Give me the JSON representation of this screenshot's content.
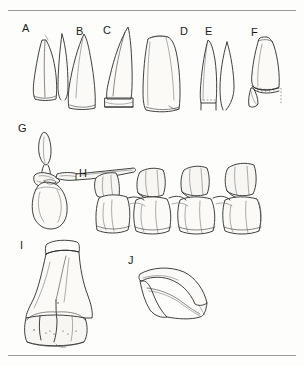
{
  "plate": {
    "title": "Fossil element plate",
    "background_color": "#fdfdfb",
    "ink_color": "#2b2b2b",
    "width": 304,
    "height": 366,
    "style": "stippled pen-and-ink scientific illustration",
    "rules": [
      {
        "name": "top-rule",
        "y": 10
      },
      {
        "name": "bottom-rule",
        "y": 355
      }
    ]
  },
  "figures": [
    {
      "letter": "A",
      "label_x": 22,
      "label_y": 28,
      "subject": "tooth crown, recurved, stippled, with adjacent partial outline",
      "group": "teeth"
    },
    {
      "letter": "B",
      "label_x": 76,
      "label_y": 31,
      "subject": "tooth crown, strongly recurved, densely stippled",
      "group": "teeth"
    },
    {
      "letter": "C",
      "label_x": 103,
      "label_y": 30,
      "subject": "tooth crown with hatched serrated basal band",
      "group": "teeth"
    },
    {
      "letter": "D",
      "label_x": 180,
      "label_y": 31,
      "subject": "broad blunt tooth crown, stippled",
      "group": "teeth"
    },
    {
      "letter": "E",
      "label_x": 205,
      "label_y": 31,
      "subject": "narrow tooth crown with dashed basal line and separate outline",
      "group": "teeth"
    },
    {
      "letter": "F",
      "label_x": 251,
      "label_y": 32,
      "subject": "tooth crown fragment with denticulate margin and small detached fragment",
      "group": "teeth"
    },
    {
      "letter": "G",
      "label_x": 18,
      "label_y": 128,
      "subject": "cervical vertebra in lateral view, tall neural spine and ovoid centrum",
      "group": "vertebrae"
    },
    {
      "letter": "H",
      "label_x": 79,
      "label_y": 173,
      "subject": "articulated series of four dorsal vertebrae in lateral view",
      "group": "vertebrae"
    },
    {
      "letter": "I",
      "label_x": 20,
      "label_y": 245,
      "subject": "distal end of long bone with cross-hatched broken proximal surface and expanded condyles",
      "group": "limb"
    },
    {
      "letter": "J",
      "label_x": 128,
      "label_y": 260,
      "subject": "curved ungual (claw) with lateral groove",
      "group": "claw"
    }
  ]
}
